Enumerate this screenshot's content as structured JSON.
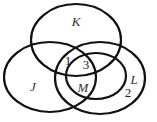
{
  "diagram": {
    "type": "venn",
    "sets": [
      {
        "name": "K",
        "cx": 76,
        "cy": 40,
        "rx": 45,
        "ry": 36,
        "label_x": 76,
        "label_y": 26
      },
      {
        "name": "J",
        "cx": 50,
        "cy": 77,
        "rx": 46,
        "ry": 35,
        "label_x": 33,
        "label_y": 91
      },
      {
        "name": "L",
        "cx": 100,
        "cy": 78,
        "rx": 45,
        "ry": 36,
        "label_x": 134,
        "label_y": 84
      },
      {
        "name": "M",
        "cx": 96,
        "cy": 76,
        "rx": 30,
        "ry": 23,
        "label_x": 83,
        "label_y": 92
      }
    ],
    "region_values": [
      {
        "value": "1",
        "x": 68,
        "y": 65
      },
      {
        "value": "3",
        "x": 86,
        "y": 69
      },
      {
        "value": "2",
        "x": 128,
        "y": 97
      }
    ],
    "stroke_color": "#111111",
    "background": "#ffffff"
  }
}
